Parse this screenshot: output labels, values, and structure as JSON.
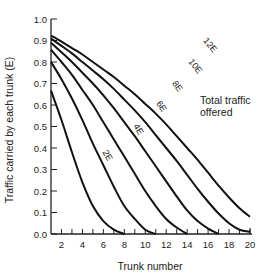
{
  "chart_data": {
    "type": "line",
    "title": "",
    "xlabel": "Trunk number",
    "ylabel": "Traffic carried by each trunk (E)",
    "xlim": [
      1,
      20
    ],
    "ylim": [
      0.0,
      1.0
    ],
    "grid": false,
    "x_ticks": [
      2,
      4,
      6,
      8,
      10,
      12,
      14,
      16,
      18,
      20
    ],
    "y_ticks": [
      "0.0",
      "0.1",
      "0.2",
      "0.3",
      "0.4",
      "0.5",
      "0.6",
      "0.7",
      "0.8",
      "0.9",
      "1.0"
    ],
    "annotation": "Total traffic offered",
    "series": [
      {
        "name": "2E",
        "x": [
          1,
          2,
          3,
          4,
          5,
          6,
          7,
          8
        ],
        "values": [
          0.667,
          0.53,
          0.38,
          0.24,
          0.13,
          0.06,
          0.02,
          0.0
        ]
      },
      {
        "name": "4E",
        "x": [
          1,
          2,
          3,
          4,
          5,
          6,
          7,
          8,
          9,
          10,
          11
        ],
        "values": [
          0.8,
          0.72,
          0.63,
          0.53,
          0.42,
          0.32,
          0.22,
          0.13,
          0.07,
          0.02,
          0.0
        ]
      },
      {
        "name": "6E",
        "x": [
          1,
          2,
          3,
          4,
          5,
          6,
          7,
          8,
          9,
          10,
          11,
          12,
          13,
          14
        ],
        "values": [
          0.857,
          0.8,
          0.74,
          0.67,
          0.6,
          0.52,
          0.44,
          0.36,
          0.28,
          0.2,
          0.13,
          0.07,
          0.03,
          0.0
        ]
      },
      {
        "name": "8E",
        "x": [
          1,
          2,
          3,
          4,
          5,
          6,
          7,
          8,
          9,
          10,
          11,
          12,
          13,
          14,
          15,
          16,
          17
        ],
        "values": [
          0.889,
          0.845,
          0.8,
          0.75,
          0.7,
          0.645,
          0.585,
          0.52,
          0.455,
          0.385,
          0.315,
          0.245,
          0.175,
          0.11,
          0.06,
          0.025,
          0.0
        ]
      },
      {
        "name": "10E",
        "x": [
          1,
          2,
          3,
          4,
          5,
          6,
          7,
          8,
          9,
          10,
          11,
          12,
          13,
          14,
          15,
          16,
          17,
          18,
          19,
          20
        ],
        "values": [
          0.909,
          0.875,
          0.84,
          0.8,
          0.76,
          0.72,
          0.675,
          0.625,
          0.575,
          0.52,
          0.46,
          0.4,
          0.34,
          0.275,
          0.21,
          0.15,
          0.095,
          0.05,
          0.02,
          0.01
        ]
      },
      {
        "name": "12E",
        "x": [
          1,
          2,
          3,
          4,
          5,
          6,
          7,
          8,
          9,
          10,
          11,
          12,
          13,
          14,
          15,
          16,
          17,
          18,
          19,
          20
        ],
        "values": [
          0.923,
          0.895,
          0.865,
          0.835,
          0.8,
          0.765,
          0.73,
          0.69,
          0.65,
          0.605,
          0.56,
          0.51,
          0.455,
          0.4,
          0.345,
          0.285,
          0.225,
          0.17,
          0.12,
          0.08
        ]
      }
    ]
  }
}
